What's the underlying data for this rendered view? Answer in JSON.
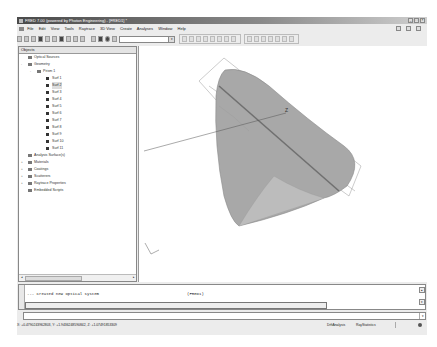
{
  "window": {
    "title": "FRED 7.00 (powered by Photon Engineering) - [FRED1] *",
    "controls": [
      "minimize",
      "maximize",
      "close"
    ]
  },
  "menu": {
    "items": [
      "File",
      "Edit",
      "View",
      "Tools",
      "Raytrace",
      "3D View",
      "Create",
      "Analyses",
      "Window",
      "Help"
    ]
  },
  "toolbar": {
    "icons": [
      "new-icon",
      "open-icon",
      "open-folder-icon",
      "save-icon",
      "cut-icon",
      "copy-icon",
      "paste-icon",
      "print-icon",
      "help-icon",
      "wand-icon",
      "zoom-icon",
      "render-icon",
      "globe-icon",
      "grid-icon"
    ],
    "combo_value": "",
    "view_icons": [
      "select-icon",
      "view1-icon",
      "view2-icon",
      "view3-icon",
      "view4-icon",
      "arrow-left-icon",
      "arrow-right-icon",
      "axes-icon"
    ],
    "raytrace_icons": [
      "trace1-icon",
      "trace2-icon",
      "trace3-icon",
      "trace4-icon",
      "trace5-icon",
      "trace6-icon",
      "trace7-icon"
    ]
  },
  "objects_panel": {
    "header": "Objects",
    "tree": [
      {
        "label": "Optical Sources",
        "level": 1,
        "expander": "",
        "icon": "folder"
      },
      {
        "label": "Geometry",
        "level": 1,
        "expander": "-",
        "icon": "folder"
      },
      {
        "label": "Prism 1",
        "level": 2,
        "expander": "-",
        "icon": "assembly"
      },
      {
        "label": "Surf 1",
        "level": 3,
        "expander": "",
        "icon": "surface"
      },
      {
        "label": "Surf 2",
        "level": 3,
        "expander": "",
        "icon": "surface",
        "selected": true
      },
      {
        "label": "Surf 3",
        "level": 3,
        "expander": "",
        "icon": "surface"
      },
      {
        "label": "Surf 4",
        "level": 3,
        "expander": "",
        "icon": "surface"
      },
      {
        "label": "Surf 5",
        "level": 3,
        "expander": "",
        "icon": "surface"
      },
      {
        "label": "Surf 6",
        "level": 3,
        "expander": "",
        "icon": "surface"
      },
      {
        "label": "Surf 7",
        "level": 3,
        "expander": "",
        "icon": "surface"
      },
      {
        "label": "Surf 8",
        "level": 3,
        "expander": "",
        "icon": "surface"
      },
      {
        "label": "Surf 9",
        "level": 3,
        "expander": "",
        "icon": "surface-alt"
      },
      {
        "label": "Surf 10",
        "level": 3,
        "expander": "",
        "icon": "surface-alt"
      },
      {
        "label": "Surf 11",
        "level": 3,
        "expander": "",
        "icon": "surface-alt"
      },
      {
        "label": "Analysis Surface(s)",
        "level": 1,
        "expander": "",
        "icon": "folder"
      },
      {
        "label": "Materials",
        "level": 1,
        "expander": "+",
        "icon": "folder"
      },
      {
        "label": "Coatings",
        "level": 1,
        "expander": "+",
        "icon": "folder"
      },
      {
        "label": "Scatterers",
        "level": 1,
        "expander": "+",
        "icon": "folder"
      },
      {
        "label": "Raytrace Properties",
        "level": 1,
        "expander": "+",
        "icon": "folder"
      },
      {
        "label": "Embedded Scripts",
        "level": 1,
        "expander": "",
        "icon": "folder"
      }
    ]
  },
  "viewport": {
    "axis_label": "Z",
    "object": "prism",
    "colors": {
      "solid": "#a8a8a8",
      "edge": "#777777",
      "bbox": "#888888"
    }
  },
  "output": {
    "line": "--- Created new optical system",
    "source": "(FRED1)"
  },
  "command": {
    "value": ""
  },
  "status": {
    "coords": "X: +0.4790243962803,  Y: +1.9436248590842,  Z: +1.07491853309",
    "panel1": "DrftAnalysis",
    "panel2": "RayStatistics"
  }
}
